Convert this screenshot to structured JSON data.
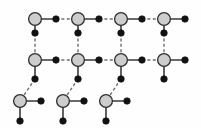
{
  "figure": {
    "background_color": "#fefefe",
    "width": 201,
    "height": 128
  },
  "style": {
    "major_node_fill": "#cdcdcd",
    "major_node_stroke": "#2f2f2f",
    "major_node_radius": 6.4,
    "minor_node_fill": "#121212",
    "minor_node_radius": 3.3,
    "solid_edge_color": "#3a3a3a",
    "dashed_edge_color": "#6d6d6d",
    "dash_pattern": "3 2.4"
  },
  "legend": {
    "major_node_label": "gray node",
    "minor_node_label": "black node",
    "solid_edge_label": "solid link",
    "dashed_edge_label": "dashed link"
  },
  "rows": {
    "top_y": 19,
    "middle_y": 60,
    "bottom_y": 101,
    "bridge_top_y": 33,
    "bridge_bottom_y": 77,
    "pendant_y": 121
  },
  "columns": {
    "major_x": [
      35,
      78,
      121,
      164
    ],
    "bottom_major_x": [
      20,
      63,
      106
    ],
    "spacing": 43
  },
  "major_nodes": [
    {
      "id": "T1",
      "x": 35,
      "y": 19,
      "row": "top"
    },
    {
      "id": "T2",
      "x": 78,
      "y": 19,
      "row": "top"
    },
    {
      "id": "T3",
      "x": 121,
      "y": 19,
      "row": "top"
    },
    {
      "id": "T4",
      "x": 164,
      "y": 19,
      "row": "top"
    },
    {
      "id": "M1",
      "x": 35,
      "y": 60,
      "row": "middle"
    },
    {
      "id": "M2",
      "x": 78,
      "y": 60,
      "row": "middle"
    },
    {
      "id": "M3",
      "x": 121,
      "y": 60,
      "row": "middle"
    },
    {
      "id": "M4",
      "x": 164,
      "y": 60,
      "row": "middle"
    },
    {
      "id": "B1",
      "x": 20,
      "y": 101,
      "row": "bottom"
    },
    {
      "id": "B2",
      "x": 63,
      "y": 101,
      "row": "bottom"
    },
    {
      "id": "B3",
      "x": 106,
      "y": 101,
      "row": "bottom"
    }
  ],
  "minor_nodes": [
    {
      "id": "t1r",
      "x": 56,
      "y": 19
    },
    {
      "id": "t2r",
      "x": 99,
      "y": 19
    },
    {
      "id": "t3r",
      "x": 142,
      "y": 19
    },
    {
      "id": "t4r",
      "x": 185,
      "y": 19
    },
    {
      "id": "v1t",
      "x": 35,
      "y": 33
    },
    {
      "id": "v2t",
      "x": 78,
      "y": 33
    },
    {
      "id": "v3t",
      "x": 121,
      "y": 33
    },
    {
      "id": "v4t",
      "x": 164,
      "y": 33
    },
    {
      "id": "m1r",
      "x": 56,
      "y": 60
    },
    {
      "id": "m2r",
      "x": 99,
      "y": 60
    },
    {
      "id": "m3r",
      "x": 142,
      "y": 60
    },
    {
      "id": "m4r",
      "x": 185,
      "y": 60
    },
    {
      "id": "v1b",
      "x": 35,
      "y": 79
    },
    {
      "id": "v2b",
      "x": 78,
      "y": 79
    },
    {
      "id": "v3b",
      "x": 121,
      "y": 79
    },
    {
      "id": "v4b",
      "x": 164,
      "y": 79
    },
    {
      "id": "b1r",
      "x": 41,
      "y": 101
    },
    {
      "id": "b2r",
      "x": 84,
      "y": 101
    },
    {
      "id": "b3r",
      "x": 127,
      "y": 101
    },
    {
      "id": "b1d",
      "x": 20,
      "y": 121
    },
    {
      "id": "b2d",
      "x": 63,
      "y": 121
    },
    {
      "id": "b3d",
      "x": 106,
      "y": 121
    }
  ],
  "edges_solid": [
    {
      "from": "T1",
      "to": "t1r"
    },
    {
      "from": "T2",
      "to": "t2r"
    },
    {
      "from": "T3",
      "to": "t3r"
    },
    {
      "from": "T4",
      "to": "t4r"
    },
    {
      "from": "T1",
      "to": "v1t"
    },
    {
      "from": "T2",
      "to": "v2t"
    },
    {
      "from": "T3",
      "to": "v3t"
    },
    {
      "from": "T4",
      "to": "v4t"
    },
    {
      "from": "M1",
      "to": "m1r"
    },
    {
      "from": "M2",
      "to": "m2r"
    },
    {
      "from": "M3",
      "to": "m3r"
    },
    {
      "from": "M4",
      "to": "m4r"
    },
    {
      "from": "M1",
      "to": "v1b"
    },
    {
      "from": "M2",
      "to": "v2b"
    },
    {
      "from": "M3",
      "to": "v3b"
    },
    {
      "from": "M4",
      "to": "v4b"
    },
    {
      "from": "B1",
      "to": "b1r"
    },
    {
      "from": "B2",
      "to": "b2r"
    },
    {
      "from": "B3",
      "to": "b3r"
    },
    {
      "from": "B1",
      "to": "b1d"
    },
    {
      "from": "B2",
      "to": "b2d"
    },
    {
      "from": "B3",
      "to": "b3d"
    }
  ],
  "edges_dashed": [
    {
      "from": "t1r",
      "to": "T2"
    },
    {
      "from": "t2r",
      "to": "T3"
    },
    {
      "from": "t3r",
      "to": "T4"
    },
    {
      "from": "m1r",
      "to": "M2"
    },
    {
      "from": "m2r",
      "to": "M3"
    },
    {
      "from": "m3r",
      "to": "M4"
    },
    {
      "from": "v1t",
      "to": "M1"
    },
    {
      "from": "v2t",
      "to": "M2"
    },
    {
      "from": "v3t",
      "to": "M3"
    },
    {
      "from": "v4t",
      "to": "M4"
    },
    {
      "from": "v1b",
      "to": "B1"
    },
    {
      "from": "v2b",
      "to": "B2"
    },
    {
      "from": "v3b",
      "to": "B3"
    }
  ]
}
